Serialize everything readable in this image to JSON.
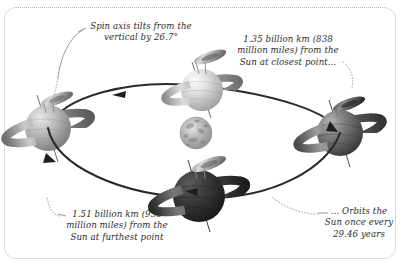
{
  "diagram": {
    "background_color": "#ffffff",
    "frame": {
      "style": "dotted",
      "color": "#b9b9b9",
      "corner_radius_px": 12
    },
    "callouts": [
      {
        "id": "tilt",
        "text": "Spin axis tilts from the\nvertical by 26.7°",
        "leader": "dotted-curve-down-left",
        "anchor": "top-left-planet"
      },
      {
        "id": "closest",
        "text": "1.35 billion km (838\nmillion miles) from the\nSun at closest point...",
        "leader": "dotted-curve-down-right",
        "anchor": "right-planet"
      },
      {
        "id": "furthest",
        "text": "1.51 billion km (938\nmillion miles) from the\nSun at furthest point",
        "leader": "dotted-curve-up-left",
        "anchor": "left-planet"
      },
      {
        "id": "period",
        "text": "... Orbits the\nSun once every\n29.46 years",
        "leader": "dotted-curve-up-left",
        "anchor": "orbit-bottom-arrow"
      }
    ],
    "bodies": [
      {
        "id": "sun",
        "name": "Sun",
        "kind": "star",
        "cx": 196,
        "cy": 133,
        "r": 16
      },
      {
        "id": "planet-top",
        "name": "Saturn at top of orbit",
        "kind": "ringed-planet",
        "cx": 202,
        "cy": 90,
        "r": 21,
        "shade": "light"
      },
      {
        "id": "planet-left",
        "name": "Saturn at furthest point",
        "kind": "ringed-planet",
        "cx": 48,
        "cy": 128,
        "r": 23,
        "shade": "mid"
      },
      {
        "id": "planet-right",
        "name": "Saturn at closest point",
        "kind": "ringed-planet",
        "cx": 340,
        "cy": 133,
        "r": 23,
        "shade": "dark"
      },
      {
        "id": "planet-bottom",
        "name": "Saturn at front of orbit",
        "kind": "ringed-planet",
        "cx": 199,
        "cy": 196,
        "r": 26,
        "shade": "darkest"
      }
    ],
    "orbit": {
      "shape": "ellipse",
      "direction": "counter-clockwise",
      "arrow_count": 4,
      "line_color": "#2a2a2a"
    },
    "colors": {
      "ink": "#2b2b2b",
      "orbit_line": "#2a2a2a",
      "leader_line": "#9a9a9a",
      "frame": "#b9b9b9",
      "planet_light": "#e8e8e8",
      "planet_mid": "#9a9a9a",
      "planet_dark": "#5a5a5a",
      "planet_darkest": "#2e2e2e"
    }
  }
}
